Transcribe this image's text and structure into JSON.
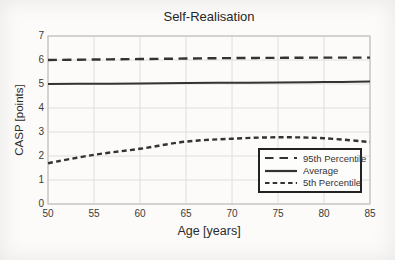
{
  "chart_data": {
    "type": "line",
    "title": "Self-Realisation",
    "xlabel": "Age [years]",
    "ylabel": "CASP [points]",
    "x": [
      50,
      55,
      60,
      65,
      70,
      75,
      80,
      85
    ],
    "xlim": [
      50,
      85
    ],
    "ylim": [
      0,
      7
    ],
    "x_ticks": [
      50,
      55,
      60,
      65,
      70,
      75,
      80,
      85
    ],
    "y_ticks": [
      0,
      1,
      2,
      3,
      4,
      5,
      6,
      7
    ],
    "grid": true,
    "legend_position": "lower right",
    "series": [
      {
        "name": "95th Percentile",
        "style": "dashed-long",
        "values": [
          6.0,
          6.02,
          6.04,
          6.06,
          6.08,
          6.09,
          6.1,
          6.1
        ]
      },
      {
        "name": "Average",
        "style": "solid",
        "values": [
          5.0,
          5.01,
          5.02,
          5.04,
          5.05,
          5.06,
          5.08,
          5.1
        ]
      },
      {
        "name": "5th Percentile",
        "style": "dashed-short",
        "values": [
          1.7,
          2.05,
          2.3,
          2.6,
          2.72,
          2.78,
          2.74,
          2.58
        ]
      }
    ],
    "colors": {
      "line": "#333333",
      "grid": "#dedede",
      "axis": "#c2c2c2",
      "text": "#333333",
      "legend_border": "#222222",
      "background": "#fcfbf9"
    }
  }
}
